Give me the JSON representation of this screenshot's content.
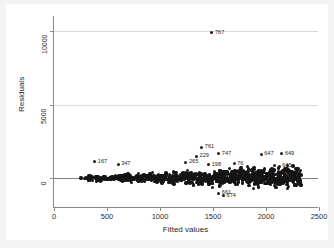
{
  "chart_data": {
    "type": "scatter",
    "title": "",
    "xlabel": "Fitted values",
    "ylabel": "Residuals",
    "xlim": [
      0,
      2500
    ],
    "ylim": [
      -2000,
      11000
    ],
    "xticks": [
      0,
      500,
      1000,
      1500,
      2000,
      2500
    ],
    "xtick_labels": [
      "0",
      "500",
      "1000",
      "1500",
      "2000",
      "2500"
    ],
    "yticks": [
      0,
      5000,
      10000
    ],
    "ytick_labels": [
      "0",
      "5000",
      "10000"
    ],
    "grid": true,
    "gridlines_y": [
      5000,
      10000
    ],
    "zero_reference_line": 0,
    "legend": "none",
    "marker": {
      "shape": "circle",
      "color": "#1d1d1d",
      "size": 3
    },
    "labeled_points": [
      {
        "label": "767",
        "x": 1490,
        "y": 9850
      },
      {
        "label": "761",
        "x": 1395,
        "y": 2130
      },
      {
        "label": "747",
        "x": 1555,
        "y": 1690
      },
      {
        "label": "229",
        "x": 1345,
        "y": 1495
      },
      {
        "label": "647",
        "x": 1955,
        "y": 1640
      },
      {
        "label": "649",
        "x": 2150,
        "y": 1660
      },
      {
        "label": "167",
        "x": 385,
        "y": 1125
      },
      {
        "label": "347",
        "x": 605,
        "y": 955
      },
      {
        "label": "265",
        "x": 1245,
        "y": 1090
      },
      {
        "label": "198",
        "x": 1460,
        "y": 935
      },
      {
        "label": "645",
        "x": 2125,
        "y": 820
      },
      {
        "label": "76",
        "x": 1700,
        "y": 1010
      },
      {
        "label": "661",
        "x": 1555,
        "y": -1010
      },
      {
        "label": "674",
        "x": 1600,
        "y": -1180
      }
    ],
    "cloud": {
      "n_points": 900,
      "x_range": [
        250,
        2330
      ],
      "spread_note": "residual dispersion widens with fitted values (heteroskedastic fan)",
      "y_spread_at_min_x": 210,
      "y_spread_at_max_x": 980
    }
  }
}
